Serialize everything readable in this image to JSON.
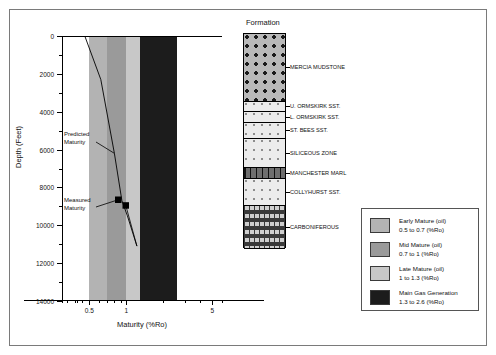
{
  "figure": {
    "formation_title": "Formation"
  },
  "chart_data": {
    "type": "line",
    "title": "",
    "xlabel": "Maturity (%Ro)",
    "ylabel": "Depth (Feet)",
    "xscale": "log",
    "xlim": [
      0.3,
      6
    ],
    "ylim": [
      14000,
      0
    ],
    "xticks": [
      0.5,
      1,
      5
    ],
    "xticklabels": [
      "0.5",
      "1",
      "5"
    ],
    "yticks": [
      0,
      2000,
      4000,
      6000,
      8000,
      10000,
      12000,
      14000
    ],
    "yticklabels": [
      "0",
      "2000",
      "4000",
      "6000",
      "8000",
      "10000",
      "12000",
      "14000"
    ],
    "yminorstep": 1000,
    "grid": false,
    "legend_position": "outside-right-bottom",
    "maturity_bands": [
      {
        "name": "Early Mature (oil)",
        "from": 0.5,
        "to": 0.7,
        "color": "#b3b3b3"
      },
      {
        "name": "Mid Mature (oil)",
        "from": 0.7,
        "to": 1.0,
        "color": "#9a9a9a"
      },
      {
        "name": "Late Mature (oil)",
        "from": 1.0,
        "to": 1.3,
        "color": "#c8c8c8"
      },
      {
        "name": "Main Gas Generation",
        "from": 1.3,
        "to": 2.6,
        "color": "#1c1c1c"
      }
    ],
    "series": [
      {
        "name": "Predicted Maturity",
        "type": "line",
        "x": [
          0.46,
          0.62,
          0.8,
          0.92,
          1.02,
          1.22
        ],
        "y": [
          0,
          2300,
          6200,
          8700,
          9500,
          11100
        ]
      },
      {
        "name": "Measured Maturity",
        "type": "scatter",
        "marker": "square",
        "x": [
          0.86,
          0.99
        ],
        "y": [
          8650,
          8950
        ]
      }
    ],
    "annotations": [
      {
        "text": "Predicted Maturity",
        "target_x": 0.8,
        "target_y": 6200
      },
      {
        "text": "Measured Maturity",
        "target_x": 0.86,
        "target_y": 8650
      }
    ]
  },
  "stratigraphy": {
    "units": [
      {
        "label": "MERCIA MUDSTONE",
        "pattern": "halite-stipple"
      },
      {
        "label": "U. ORMSKIRK SST.",
        "pattern": "sand-dots"
      },
      {
        "label": "L. ORMSKIRK SST.",
        "pattern": "sand-dots"
      },
      {
        "label": "ST. BEES SST.",
        "pattern": "sand-dots"
      },
      {
        "label": "SILICEOUS ZONE",
        "pattern": "sand-dots"
      },
      {
        "label": "MANCHESTER MARL",
        "pattern": "marl-band"
      },
      {
        "label": "COLLYHURST SST.",
        "pattern": "sand-dots"
      },
      {
        "label": "CARBONIFEROUS",
        "pattern": "coal-dashes"
      }
    ]
  },
  "legend": {
    "items": [
      {
        "label": "Early Mature (oil)",
        "range": "0.5 to 0.7 (%Ro)",
        "color": "#b3b3b3"
      },
      {
        "label": "Mid Mature (oil)",
        "range": "0.7 to 1 (%Ro)",
        "color": "#9a9a9a"
      },
      {
        "label": "Late Mature (oil)",
        "range": "1 to 1.3 (%Ro)",
        "color": "#c8c8c8"
      },
      {
        "label": "Main Gas Generation",
        "range": "1.3 to 2.6 (%Ro)",
        "color": "#1c1c1c"
      }
    ]
  },
  "annotations": {
    "predicted_line1": "Predicted",
    "predicted_line2": "Maturity",
    "measured_line1": "Measured",
    "measured_line2": "Maturity"
  }
}
